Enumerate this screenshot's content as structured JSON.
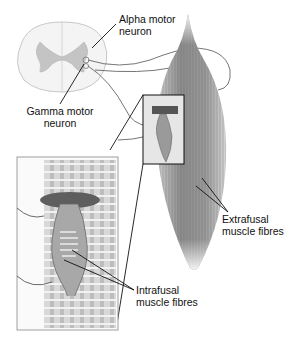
{
  "diagram": {
    "labels": {
      "alpha_line1": "Alpha motor",
      "alpha_line2": "neuron",
      "gamma_line1": "Gamma motor",
      "gamma_line2": "neuron",
      "extrafusal_line1": "Extrafusal",
      "extrafusal_line2": "muscle fibres",
      "intrafusal_line1": "Intrafusal",
      "intrafusal_line2": "muscle fibres"
    },
    "parts": [
      "spinal-cord-cross-section",
      "skeletal-muscle",
      "muscle-spindle-inset",
      "motor-nerve-fibres"
    ],
    "colors": {
      "outline": "#111111",
      "muscle": "#8a8a8a",
      "grey-matter": "#bdbdbd",
      "background": "#ffffff"
    }
  }
}
